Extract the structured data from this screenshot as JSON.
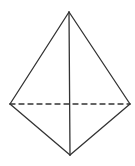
{
  "diagram": {
    "type": "bipyramid-solid",
    "width": 135,
    "height": 166,
    "background": "#ffffff",
    "stroke_color": "#333333",
    "stroke_width": 1.3,
    "vertices": {
      "top": [
        69,
        12
      ],
      "left": [
        10,
        104
      ],
      "right": [
        130,
        104
      ],
      "bottom": [
        70,
        155
      ]
    },
    "solid_edges": [
      [
        "top",
        "left"
      ],
      [
        "top",
        "right"
      ],
      [
        "top",
        "bottom"
      ],
      [
        "left",
        "bottom"
      ],
      [
        "right",
        "bottom"
      ]
    ],
    "dashed_edges": [
      [
        "left",
        "right"
      ]
    ],
    "dash_pattern": "5 4"
  }
}
